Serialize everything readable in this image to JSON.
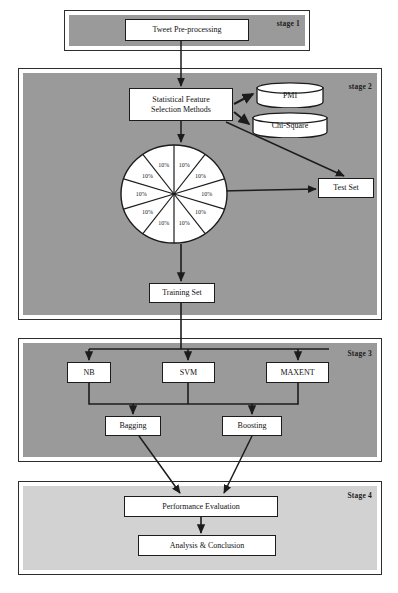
{
  "diagram": {
    "colors": {
      "stage_fill": "#9a9a9a",
      "stage_fill_light": "#d2d2d2",
      "node_fill": "#ffffff",
      "stroke": "#1c1c1c",
      "page_background": "#ffffff"
    },
    "stages": [
      {
        "id": "stage1",
        "label": "stage 1"
      },
      {
        "id": "stage2",
        "label": "stage 2"
      },
      {
        "id": "stage3",
        "label": "Stage 3"
      },
      {
        "id": "stage4",
        "label": "Stage 4"
      }
    ],
    "nodes": {
      "tweet_preprocessing": "Tweet Pre-processing",
      "statistical_feature_line1": "Statistical Feature",
      "statistical_feature_line2": "Selection Methods",
      "pmi": "PMI",
      "chi_square": "Chi-Square",
      "test_set": "Test Set",
      "training_set": "Training Set",
      "nb": "NB",
      "svm": "SVM",
      "maxent": "MAXENT",
      "bagging": "Bagging",
      "boosting": "Boosting",
      "performance_evaluation": "Performance Evaluation",
      "analysis_conclusion": "Analysis & Conclusion"
    }
  },
  "chart_data": {
    "type": "pie",
    "title": "",
    "categories": [
      "10%",
      "10%",
      "10%",
      "10%",
      "10%",
      "10%",
      "10%",
      "10%",
      "10%",
      "10%"
    ],
    "values": [
      10,
      10,
      10,
      10,
      10,
      10,
      10,
      10,
      10,
      10
    ],
    "labels": [
      "10%",
      "10%",
      "10%",
      "10%",
      "10%",
      "10%",
      "10%",
      "10%",
      "10%",
      "10%"
    ],
    "slice_count": 10,
    "slice_fill": "#ffffff",
    "slice_stroke": "#1c1c1c",
    "legend": "none",
    "xlabel": "",
    "ylabel": ""
  }
}
